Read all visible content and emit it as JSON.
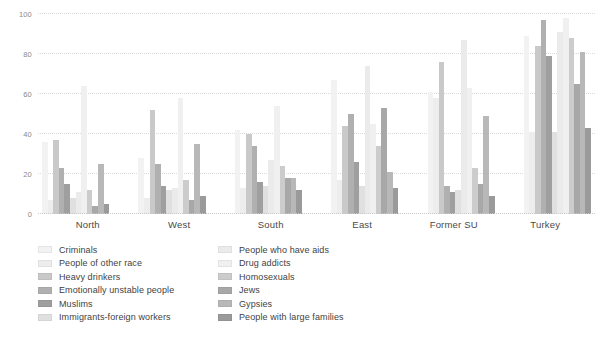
{
  "chart_data": {
    "type": "bar",
    "title": "",
    "subtitle": "",
    "xlabel": "",
    "ylabel": "",
    "ylim": [
      0,
      100
    ],
    "yticks": [
      0,
      20,
      40,
      60,
      80,
      100
    ],
    "grid": true,
    "legend_position": "bottom",
    "categories": [
      "North",
      "West",
      "South",
      "East",
      "Former SU",
      "Turkey"
    ],
    "series": [
      {
        "name": "Criminals",
        "color": "#f2f2f2",
        "values": [
          36,
          28,
          42,
          67,
          61,
          89
        ]
      },
      {
        "name": "People of other race",
        "color": "#ededed",
        "values": [
          7,
          8,
          13,
          17,
          58,
          41
        ]
      },
      {
        "name": "Heavy drinkers",
        "color": "#c9c9c9",
        "values": [
          37,
          52,
          40,
          44,
          76,
          84
        ]
      },
      {
        "name": "Emotionally unstable people",
        "color": "#b0b0b0",
        "values": [
          23,
          25,
          34,
          50,
          14,
          97
        ]
      },
      {
        "name": "Muslims",
        "color": "#9f9f9f",
        "values": [
          15,
          14,
          16,
          26,
          11,
          79
        ]
      },
      {
        "name": "Immigrants-foreign workers",
        "color": "#e0e0e0",
        "values": [
          8,
          12,
          14,
          14,
          12,
          41
        ]
      },
      {
        "name": "People who have aids",
        "color": "#ebebeb",
        "values": [
          11,
          13,
          27,
          74,
          87,
          91
        ]
      },
      {
        "name": "Drug addicts",
        "color": "#f0f0f0",
        "values": [
          64,
          58,
          54,
          45,
          63,
          98
        ]
      },
      {
        "name": "Homosexuals",
        "color": "#cccccc",
        "values": [
          12,
          17,
          24,
          34,
          23,
          88
        ]
      },
      {
        "name": "Jews",
        "color": "#a8a8a8",
        "values": [
          4,
          7,
          18,
          53,
          15,
          65
        ]
      },
      {
        "name": "Gypsies",
        "color": "#b8b8b8",
        "values": [
          25,
          35,
          18,
          21,
          49,
          81
        ]
      },
      {
        "name": "People with large families",
        "color": "#9a9a9a",
        "values": [
          5,
          9,
          12,
          13,
          9,
          43
        ]
      }
    ]
  },
  "legend": {
    "columns": [
      {
        "items": [
          "Criminals",
          "People of other race",
          "Heavy drinkers",
          "Emotionally unstable people",
          "Muslims",
          "Immigrants-foreign workers"
        ]
      },
      {
        "items": [
          "People who have aids",
          "Drug addicts",
          "Homosexuals",
          "Jews",
          "Gypsies",
          "People with large families"
        ]
      }
    ]
  },
  "colors": {
    "background": "#ffffff",
    "gridline": "#d9d9d9",
    "axis_text": "#8a8a8a",
    "label_text": "#4a4a4a"
  }
}
